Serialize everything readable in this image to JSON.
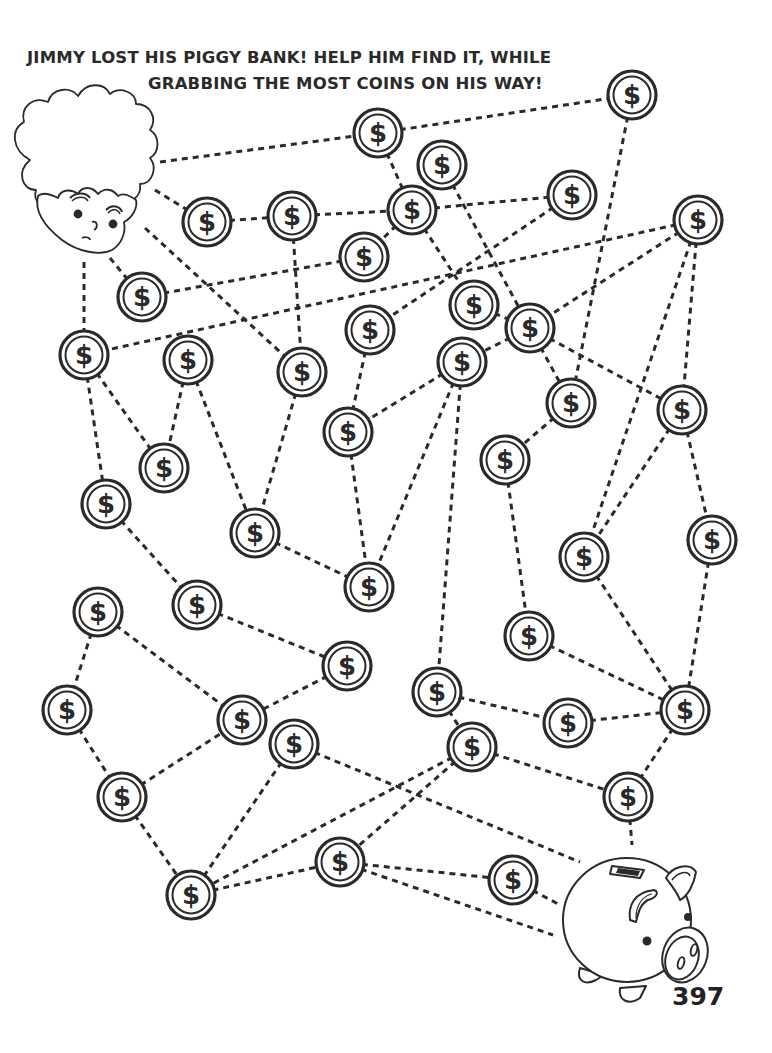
{
  "puzzle": {
    "title_line_1": "JIMMY LOST HIS PIGGY BANK! HELP HIM FIND IT, WHILE",
    "title_line_2": "GRABBING THE MOST COINS ON HIS WAY!",
    "page_number": "397",
    "coin_symbol": "$",
    "start": {
      "name": "Jimmy",
      "icon": "boy-face-icon"
    },
    "goal": {
      "name": "Piggy bank",
      "icon": "piggy-bank-icon"
    },
    "colors": {
      "ink": "#2a2a2a",
      "background": "#ffffff"
    }
  },
  "coins": [
    {
      "id": 1,
      "x": 632,
      "y": 95
    },
    {
      "id": 2,
      "x": 378,
      "y": 133
    },
    {
      "id": 3,
      "x": 442,
      "y": 165
    },
    {
      "id": 4,
      "x": 207,
      "y": 222
    },
    {
      "id": 5,
      "x": 292,
      "y": 216
    },
    {
      "id": 6,
      "x": 412,
      "y": 210
    },
    {
      "id": 7,
      "x": 572,
      "y": 195
    },
    {
      "id": 8,
      "x": 698,
      "y": 220
    },
    {
      "id": 9,
      "x": 364,
      "y": 257
    },
    {
      "id": 10,
      "x": 142,
      "y": 297
    },
    {
      "id": 11,
      "x": 474,
      "y": 305
    },
    {
      "id": 12,
      "x": 530,
      "y": 328
    },
    {
      "id": 13,
      "x": 370,
      "y": 330
    },
    {
      "id": 14,
      "x": 84,
      "y": 355
    },
    {
      "id": 15,
      "x": 188,
      "y": 360
    },
    {
      "id": 16,
      "x": 462,
      "y": 362
    },
    {
      "id": 17,
      "x": 302,
      "y": 372
    },
    {
      "id": 18,
      "x": 571,
      "y": 403
    },
    {
      "id": 19,
      "x": 682,
      "y": 410
    },
    {
      "id": 20,
      "x": 348,
      "y": 432
    },
    {
      "id": 21,
      "x": 505,
      "y": 460
    },
    {
      "id": 22,
      "x": 164,
      "y": 468
    },
    {
      "id": 23,
      "x": 106,
      "y": 504
    },
    {
      "id": 24,
      "x": 255,
      "y": 533
    },
    {
      "id": 25,
      "x": 712,
      "y": 540
    },
    {
      "id": 26,
      "x": 584,
      "y": 557
    },
    {
      "id": 27,
      "x": 369,
      "y": 587
    },
    {
      "id": 28,
      "x": 197,
      "y": 605
    },
    {
      "id": 29,
      "x": 98,
      "y": 612
    },
    {
      "id": 30,
      "x": 529,
      "y": 636
    },
    {
      "id": 31,
      "x": 347,
      "y": 666
    },
    {
      "id": 32,
      "x": 437,
      "y": 692
    },
    {
      "id": 33,
      "x": 67,
      "y": 710
    },
    {
      "id": 34,
      "x": 242,
      "y": 720
    },
    {
      "id": 35,
      "x": 568,
      "y": 723
    },
    {
      "id": 36,
      "x": 685,
      "y": 710
    },
    {
      "id": 37,
      "x": 294,
      "y": 744
    },
    {
      "id": 38,
      "x": 472,
      "y": 747
    },
    {
      "id": 39,
      "x": 122,
      "y": 797
    },
    {
      "id": 40,
      "x": 628,
      "y": 797
    },
    {
      "id": 41,
      "x": 340,
      "y": 862
    },
    {
      "id": 42,
      "x": 513,
      "y": 880
    },
    {
      "id": 43,
      "x": 191,
      "y": 895
    }
  ],
  "paths": [
    [
      160,
      162,
      378,
      133
    ],
    [
      378,
      133,
      632,
      95
    ],
    [
      632,
      95,
      571,
      403
    ],
    [
      378,
      133,
      412,
      210
    ],
    [
      442,
      165,
      530,
      328
    ],
    [
      155,
      190,
      207,
      222
    ],
    [
      207,
      222,
      292,
      216
    ],
    [
      292,
      216,
      412,
      210
    ],
    [
      412,
      210,
      572,
      195
    ],
    [
      412,
      210,
      364,
      257
    ],
    [
      412,
      210,
      474,
      305
    ],
    [
      572,
      195,
      370,
      330
    ],
    [
      292,
      216,
      302,
      372
    ],
    [
      364,
      257,
      142,
      297
    ],
    [
      110,
      258,
      142,
      297
    ],
    [
      698,
      220,
      84,
      355
    ],
    [
      698,
      220,
      530,
      328
    ],
    [
      698,
      220,
      584,
      557
    ],
    [
      698,
      220,
      682,
      410
    ],
    [
      84,
      262,
      84,
      355
    ],
    [
      145,
      228,
      302,
      372
    ],
    [
      84,
      355,
      164,
      468
    ],
    [
      84,
      355,
      106,
      504
    ],
    [
      188,
      360,
      164,
      468
    ],
    [
      188,
      360,
      255,
      533
    ],
    [
      302,
      372,
      255,
      533
    ],
    [
      474,
      305,
      530,
      328
    ],
    [
      530,
      328,
      571,
      403
    ],
    [
      530,
      328,
      682,
      410
    ],
    [
      530,
      328,
      462,
      362
    ],
    [
      462,
      362,
      348,
      432
    ],
    [
      370,
      330,
      348,
      432
    ],
    [
      462,
      362,
      369,
      587
    ],
    [
      462,
      362,
      437,
      692
    ],
    [
      571,
      403,
      505,
      460
    ],
    [
      348,
      432,
      369,
      587
    ],
    [
      255,
      533,
      369,
      587
    ],
    [
      682,
      410,
      584,
      557
    ],
    [
      682,
      410,
      712,
      540
    ],
    [
      505,
      460,
      529,
      636
    ],
    [
      106,
      504,
      197,
      605
    ],
    [
      584,
      557,
      685,
      710
    ],
    [
      712,
      540,
      685,
      710
    ],
    [
      529,
      636,
      685,
      710
    ],
    [
      98,
      612,
      67,
      710
    ],
    [
      98,
      612,
      242,
      720
    ],
    [
      197,
      605,
      347,
      666
    ],
    [
      347,
      666,
      242,
      720
    ],
    [
      437,
      692,
      568,
      723
    ],
    [
      568,
      723,
      685,
      710
    ],
    [
      437,
      692,
      472,
      747
    ],
    [
      685,
      710,
      628,
      797
    ],
    [
      472,
      747,
      628,
      797
    ],
    [
      628,
      797,
      632,
      845
    ],
    [
      67,
      710,
      122,
      797
    ],
    [
      122,
      797,
      242,
      720
    ],
    [
      122,
      797,
      191,
      895
    ],
    [
      294,
      744,
      191,
      895
    ],
    [
      294,
      744,
      580,
      862
    ],
    [
      472,
      747,
      191,
      895
    ],
    [
      472,
      747,
      340,
      862
    ],
    [
      191,
      895,
      340,
      862
    ],
    [
      340,
      862,
      513,
      880
    ],
    [
      340,
      862,
      553,
      935
    ],
    [
      513,
      880,
      560,
      905
    ]
  ]
}
